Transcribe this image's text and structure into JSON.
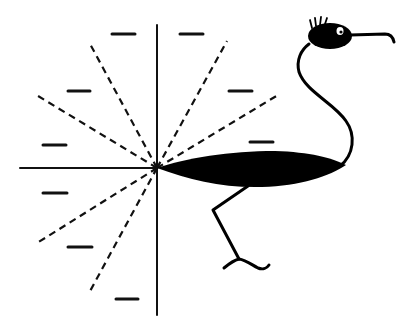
{
  "figure": {
    "background": "#ffffff",
    "ink_color": "#000000",
    "origin": [
      157,
      168
    ],
    "axes": {
      "vertical": {
        "x": 157,
        "y1": 25,
        "y2": 315
      },
      "horizontal": {
        "x1": 20,
        "x2": 157,
        "y": 168
      }
    },
    "dashed_rays": [
      {
        "to": [
          89,
          42
        ]
      },
      {
        "to": [
          38,
          96
        ]
      },
      {
        "to": [
          227,
          41
        ]
      },
      {
        "to": [
          278,
          95
        ]
      },
      {
        "to": [
          37,
          243
        ]
      },
      {
        "to": [
          89,
          293
        ]
      }
    ],
    "short_marks": [
      {
        "x1": 112,
        "y1": 34,
        "x2": 135,
        "y2": 34
      },
      {
        "x1": 180,
        "y1": 34,
        "x2": 203,
        "y2": 34
      },
      {
        "x1": 68,
        "y1": 91,
        "x2": 90,
        "y2": 91
      },
      {
        "x1": 229,
        "y1": 91,
        "x2": 252,
        "y2": 91
      },
      {
        "x1": 43,
        "y1": 145,
        "x2": 66,
        "y2": 145
      },
      {
        "x1": 250,
        "y1": 142,
        "x2": 273,
        "y2": 142
      },
      {
        "x1": 43,
        "y1": 193,
        "x2": 67,
        "y2": 193
      },
      {
        "x1": 68,
        "y1": 247,
        "x2": 92,
        "y2": 247
      },
      {
        "x1": 116,
        "y1": 299,
        "x2": 138,
        "y2": 299
      }
    ],
    "bird": {
      "parts": [
        "body",
        "neck",
        "head",
        "eye",
        "beak",
        "crest",
        "leg",
        "foot"
      ]
    }
  }
}
